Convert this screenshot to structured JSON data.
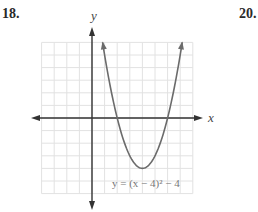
{
  "problems": {
    "left_number": "18.",
    "right_number": "20."
  },
  "graph": {
    "x_axis_label": "x",
    "y_axis_label": "y",
    "equation_label": "y = (x − 4)² − 4",
    "colors": {
      "grid": "#e2e2e2",
      "axis": "#333333",
      "curve": "#6b6b6b",
      "equation": "#777777"
    }
  },
  "chart_data": {
    "type": "line",
    "title": "",
    "xlabel": "x",
    "ylabel": "y",
    "function": "y = (x - 4)^2 - 4",
    "xlim": [
      -4,
      8
    ],
    "ylim": [
      -6,
      6
    ],
    "grid": true,
    "vertex": [
      4,
      -4
    ],
    "x_intercepts": [
      2,
      6
    ],
    "y_intercept": 12,
    "series": [
      {
        "name": "y = (x - 4)^2 - 4",
        "x": [
          0.84,
          1,
          2,
          3,
          4,
          5,
          6,
          7,
          7.16
        ],
        "y": [
          6,
          5,
          0,
          -3,
          -4,
          -3,
          0,
          5,
          6
        ]
      }
    ],
    "annotations": [
      "y = (x − 4)² − 4"
    ]
  }
}
